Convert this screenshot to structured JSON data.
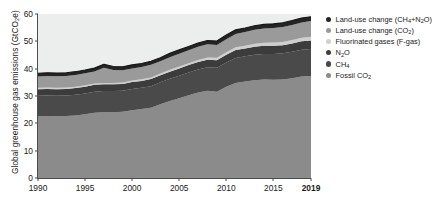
{
  "axes": {
    "ylabel": "Global greenhouse gas emissions (GtCO₂e)",
    "yticks": [
      "0",
      "10",
      "20",
      "30",
      "40",
      "50",
      "60"
    ],
    "xticks": [
      "1990",
      "1995",
      "2000",
      "2005",
      "2010",
      "2015",
      "2019"
    ],
    "xtick_bold_index": 6,
    "plot_background": "#eceded"
  },
  "legend": {
    "items": [
      {
        "label_html": "Land-use change (CH<sub>4</sub>+N<sub>2</sub>O)",
        "label": "Land-use change (CH4+N2O)",
        "color": "#242424",
        "key": "landuse_ch4_n2o"
      },
      {
        "label_html": "Land-use change (CO<sub>2</sub>)",
        "label": "Land-use change (CO2)",
        "color": "#9a9a9a",
        "key": "landuse_co2"
      },
      {
        "label_html": "Fluorinated gases (F-gas)",
        "label": "Fluorinated gases (F-gas)",
        "color": "#cfcfcf",
        "key": "fgas"
      },
      {
        "label_html": "N<sub>2</sub>O",
        "label": "N2O",
        "color": "#3c3c3c",
        "key": "n2o"
      },
      {
        "label_html": "CH<sub>4</sub>",
        "label": "CH4",
        "color": "#4a4a4a",
        "key": "ch4"
      },
      {
        "label_html": "Fossil CO<sub>2</sub>",
        "label": "Fossil CO2",
        "color": "#8b8b8b",
        "key": "fossil_co2"
      }
    ]
  },
  "chart_data": {
    "type": "area",
    "stacked": true,
    "title": "",
    "xlabel": "",
    "ylabel": "Global greenhouse gas emissions (GtCO₂e)",
    "xlim": [
      1990,
      2019
    ],
    "ylim": [
      0,
      60
    ],
    "grid": false,
    "legend_position": "right",
    "x": [
      1990,
      1991,
      1992,
      1993,
      1994,
      1995,
      1996,
      1997,
      1998,
      1999,
      2000,
      2001,
      2002,
      2003,
      2004,
      2005,
      2006,
      2007,
      2008,
      2009,
      2010,
      2011,
      2012,
      2013,
      2014,
      2015,
      2016,
      2017,
      2018,
      2019
    ],
    "series": [
      {
        "name": "Fossil CO2",
        "color": "#8b8b8b",
        "values": [
          22.6,
          22.7,
          22.6,
          22.7,
          22.9,
          23.3,
          23.9,
          24.1,
          24.1,
          24.2,
          24.8,
          25.2,
          25.7,
          27.0,
          28.2,
          29.2,
          30.3,
          31.3,
          31.9,
          31.6,
          33.4,
          34.8,
          35.3,
          35.8,
          36.0,
          35.9,
          36.0,
          36.5,
          37.1,
          37.3
        ]
      },
      {
        "name": "CH4",
        "color": "#4a4a4a",
        "values": [
          7.5,
          7.5,
          7.5,
          7.5,
          7.6,
          7.6,
          7.7,
          7.7,
          7.7,
          7.7,
          7.8,
          7.8,
          7.9,
          8.0,
          8.1,
          8.2,
          8.3,
          8.4,
          8.6,
          8.7,
          8.9,
          9.1,
          9.2,
          9.3,
          9.4,
          9.5,
          9.6,
          9.7,
          9.8,
          9.9
        ]
      },
      {
        "name": "N2O",
        "color": "#3c3c3c",
        "values": [
          2.4,
          2.4,
          2.4,
          2.4,
          2.4,
          2.5,
          2.5,
          2.5,
          2.5,
          2.5,
          2.5,
          2.5,
          2.6,
          2.6,
          2.6,
          2.7,
          2.7,
          2.7,
          2.8,
          2.8,
          2.8,
          2.9,
          2.9,
          2.9,
          3.0,
          3.0,
          3.0,
          3.0,
          3.1,
          3.1
        ]
      },
      {
        "name": "F-gas",
        "color": "#cfcfcf",
        "values": [
          0.5,
          0.5,
          0.5,
          0.5,
          0.5,
          0.5,
          0.5,
          0.5,
          0.5,
          0.5,
          0.6,
          0.6,
          0.6,
          0.6,
          0.7,
          0.7,
          0.7,
          0.8,
          0.8,
          0.9,
          0.9,
          1.0,
          1.0,
          1.1,
          1.1,
          1.2,
          1.2,
          1.3,
          1.3,
          1.4
        ]
      },
      {
        "name": "Land-use change (CO2)",
        "color": "#9a9a9a",
        "values": [
          4.1,
          4.2,
          4.2,
          4.2,
          4.3,
          4.4,
          4.4,
          5.5,
          4.7,
          4.5,
          4.4,
          4.5,
          4.6,
          4.5,
          4.6,
          4.7,
          4.7,
          4.8,
          4.8,
          4.7,
          4.8,
          4.9,
          5.0,
          5.1,
          5.2,
          5.3,
          5.4,
          5.5,
          5.6,
          5.7
        ]
      },
      {
        "name": "Land-use change (CH4+N2O)",
        "color": "#242424",
        "values": [
          1.2,
          1.2,
          1.2,
          1.2,
          1.2,
          1.2,
          1.2,
          1.3,
          1.3,
          1.3,
          1.3,
          1.3,
          1.3,
          1.3,
          1.4,
          1.4,
          1.4,
          1.4,
          1.4,
          1.4,
          1.5,
          1.5,
          1.5,
          1.5,
          1.5,
          1.5,
          1.6,
          1.6,
          1.6,
          1.6
        ]
      }
    ],
    "totals": [
      38.3,
      38.5,
      38.4,
      38.5,
      38.9,
      39.5,
      40.2,
      41.6,
      40.8,
      40.7,
      41.4,
      41.9,
      42.7,
      44.0,
      45.6,
      46.9,
      48.1,
      49.4,
      50.3,
      50.1,
      52.3,
      54.2,
      54.9,
      55.7,
      56.2,
      56.4,
      56.8,
      57.6,
      58.5,
      59.0
    ]
  }
}
